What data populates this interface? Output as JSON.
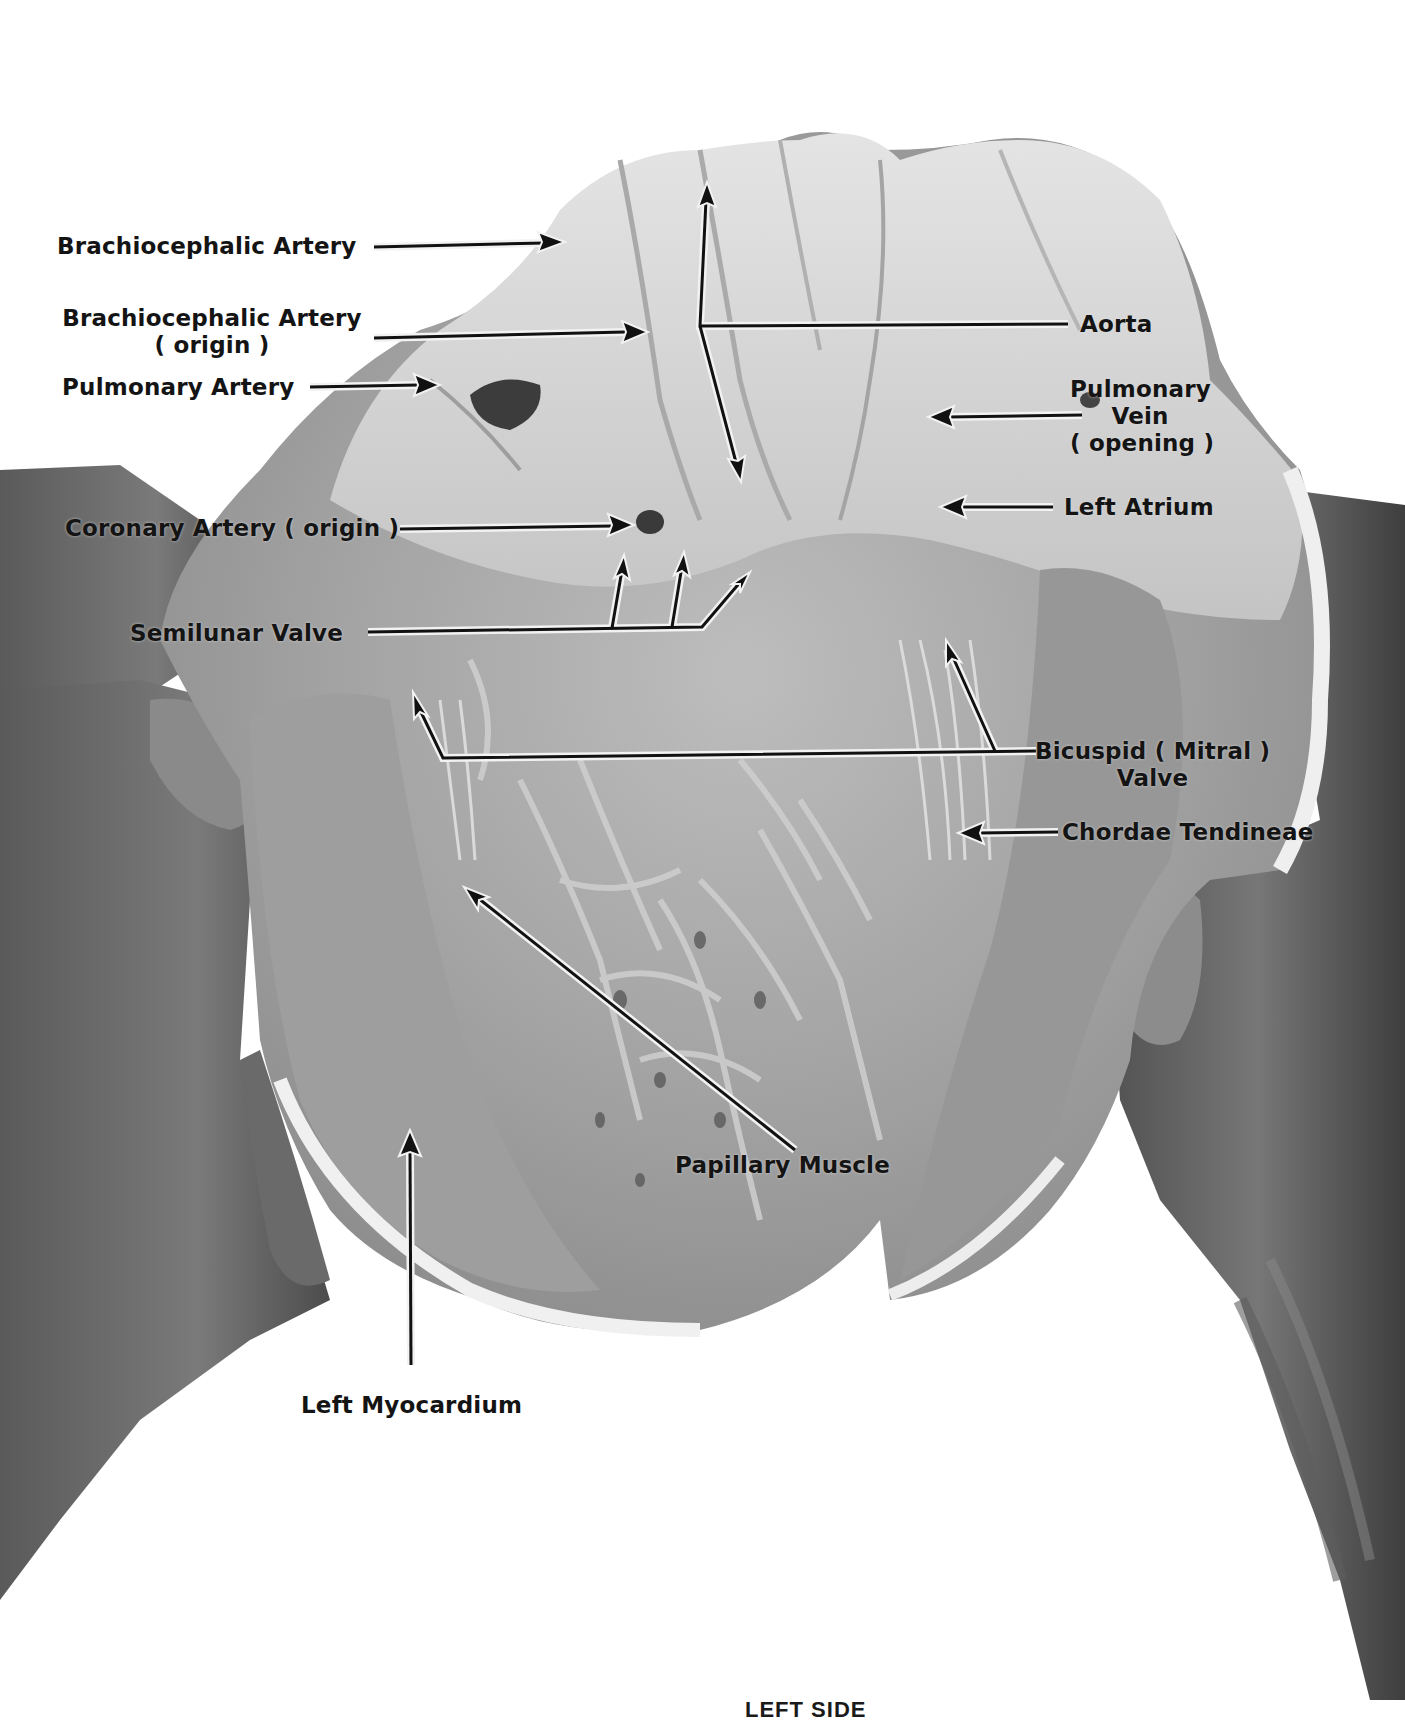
{
  "figure": {
    "palette": {
      "background": "#ffffff",
      "tissue_light": "#d9d9d9",
      "tissue_mid": "#a8a8a8",
      "tissue_dark": "#6e6e6e",
      "hand_dark": "#4a4a4a",
      "label_text": "#141414",
      "arrow_line": "#111111",
      "arrow_outline": "#f2f2f2"
    },
    "labels": {
      "brachiocephalic_artery": "Brachiocephalic Artery",
      "brachiocephalic_artery_origin_line1": "Brachiocephalic Artery",
      "brachiocephalic_artery_origin_line2": "( origin )",
      "pulmonary_artery": "Pulmonary Artery",
      "aorta": "Aorta",
      "pulmonary_vein_line1": "Pulmonary",
      "pulmonary_vein_line2": "Vein",
      "pulmonary_vein_line3": "( opening )",
      "left_atrium": "Left Atrium",
      "coronary_artery_origin": "Coronary Artery ( origin )",
      "semilunar_valve": "Semilunar Valve",
      "bicuspid_valve_line1": "Bicuspid ( Mitral )",
      "bicuspid_valve_line2": "Valve",
      "chordae_tendineae": "Chordae Tendineae",
      "papillary_muscle": "Papillary Muscle",
      "left_myocardium": "Left Myocardium"
    },
    "caption_partial": "LEFT SIDE"
  }
}
